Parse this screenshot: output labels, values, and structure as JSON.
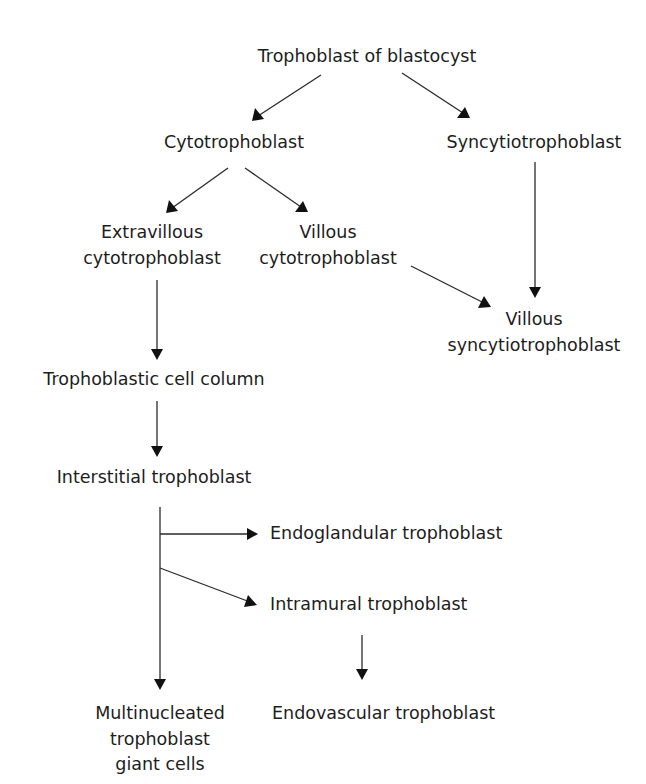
{
  "diagram": {
    "type": "flowchart",
    "nodes": {
      "trophoblast_of_blastocyst": {
        "lines": [
          "Trophoblast of blastocyst"
        ]
      },
      "cytotrophoblast": {
        "lines": [
          "Cytotrophoblast"
        ]
      },
      "syncytiotrophoblast": {
        "lines": [
          "Syncytiotrophoblast"
        ]
      },
      "extravillous_cytotrophoblast": {
        "lines": [
          "Extravillous",
          "cytotrophoblast"
        ]
      },
      "villous_cytotrophoblast": {
        "lines": [
          "Villous",
          "cytotrophoblast"
        ]
      },
      "villous_syncytiotrophoblast": {
        "lines": [
          "Villous",
          "syncytiotrophoblast"
        ]
      },
      "trophoblastic_cell_column": {
        "lines": [
          "Trophoblastic cell column"
        ]
      },
      "interstitial_trophoblast": {
        "lines": [
          "Interstitial trophoblast"
        ]
      },
      "endoglandular_trophoblast": {
        "lines": [
          "Endoglandular trophoblast"
        ]
      },
      "intramural_trophoblast": {
        "lines": [
          "Intramural trophoblast"
        ]
      },
      "multinucleated_giant_cells": {
        "lines": [
          "Multinucleated",
          "trophoblast",
          "giant cells"
        ]
      },
      "endovascular_trophoblast": {
        "lines": [
          "Endovascular trophoblast"
        ]
      }
    },
    "edges": [
      {
        "from": "Trophoblast of blastocyst",
        "to": "Cytotrophoblast"
      },
      {
        "from": "Trophoblast of blastocyst",
        "to": "Syncytiotrophoblast"
      },
      {
        "from": "Cytotrophoblast",
        "to": "Extravillous cytotrophoblast"
      },
      {
        "from": "Cytotrophoblast",
        "to": "Villous cytotrophoblast"
      },
      {
        "from": "Villous cytotrophoblast",
        "to": "Villous syncytiotrophoblast"
      },
      {
        "from": "Syncytiotrophoblast",
        "to": "Villous syncytiotrophoblast"
      },
      {
        "from": "Extravillous cytotrophoblast",
        "to": "Trophoblastic cell column"
      },
      {
        "from": "Trophoblastic cell column",
        "to": "Interstitial trophoblast"
      },
      {
        "from": "Interstitial trophoblast",
        "to": "Endoglandular trophoblast"
      },
      {
        "from": "Interstitial trophoblast",
        "to": "Intramural trophoblast"
      },
      {
        "from": "Interstitial trophoblast",
        "to": "Multinucleated trophoblast giant cells"
      },
      {
        "from": "Intramural trophoblast",
        "to": "Endovascular trophoblast"
      }
    ],
    "colors": {
      "text": "#1d1d1d",
      "line": "#2a2a2a",
      "background": "#ffffff"
    }
  }
}
